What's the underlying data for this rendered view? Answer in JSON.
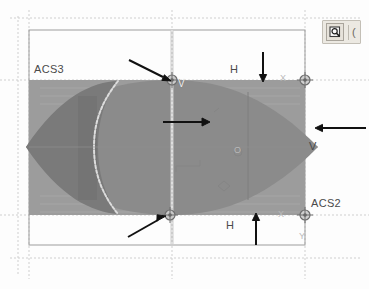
{
  "app": {
    "title": "CAD viewport",
    "background_color": "#fdfdfd"
  },
  "toolbar": {
    "visible": true,
    "zoom_button_label": "",
    "zoom_icon": "magnifier-icon",
    "fragment_text": "("
  },
  "viewport": {
    "outer_rect_label": "drawing-border",
    "colors": {
      "band_fill": "#9a9a9a",
      "shape_fill": "#8d8d8d",
      "shape_dark_fill": "#7b7b7b",
      "band_edge": "#8e8e8e",
      "guide_line": "#c8c8c8",
      "border_line": "#9d9d9d",
      "annotation": "#1a1a1a",
      "label_text": "#4a4a4a"
    }
  },
  "labels": {
    "acs3": "ACS3",
    "acs2": "ACS2",
    "h_top": "H",
    "h_bottom": "H",
    "v_right": "V",
    "v_grip_top": "V",
    "x_axis_top": "X",
    "x_axis_bottom": "X",
    "y_axis": "Y",
    "o_marker": "O"
  },
  "annotations": {
    "arrow_top_down": {
      "name": "arrow-down-top",
      "direction": "down"
    },
    "arrow_bottom_up": {
      "name": "arrow-up-bottom",
      "direction": "up"
    },
    "arrow_right_left": {
      "name": "arrow-left-right-edge",
      "direction": "left"
    },
    "arrow_center_right": {
      "name": "arrow-right-center",
      "direction": "right"
    },
    "arrow_diag_top": {
      "name": "arrow-diagonal-top-grip",
      "direction": "up-right"
    },
    "arrow_diag_bottom": {
      "name": "arrow-diagonal-bottom-grip",
      "direction": "up-right"
    }
  },
  "grips": [
    {
      "name": "grip-top-center",
      "x": 172,
      "y": 80
    },
    {
      "name": "grip-bottom-center",
      "x": 170,
      "y": 215
    },
    {
      "name": "grip-top-right",
      "x": 305,
      "y": 80
    },
    {
      "name": "grip-bottom-right",
      "x": 305,
      "y": 215
    }
  ]
}
